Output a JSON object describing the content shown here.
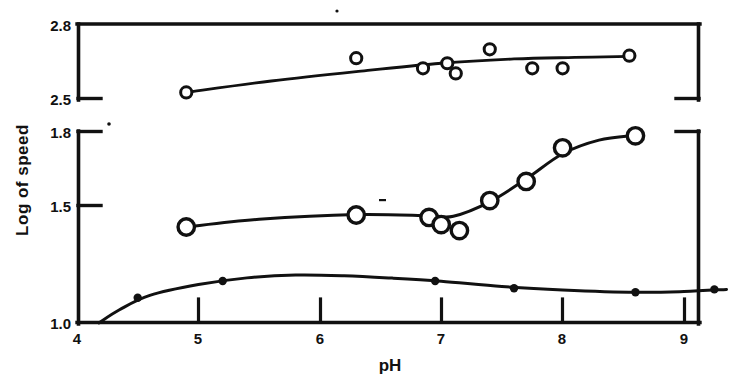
{
  "chart_data": {
    "type": "scatter",
    "title": "",
    "xlabel": "pH",
    "ylabel": "Log of speed",
    "xlim": [
      4,
      9.4
    ],
    "xticks": [
      4,
      5,
      6,
      7,
      8,
      9
    ],
    "xticklabels": [
      "4",
      "5",
      "6",
      "7",
      "8",
      "9"
    ],
    "grid": false,
    "legend": false,
    "broken_axis": true,
    "panels": [
      {
        "name": "upper-panel",
        "ylim": [
          2.5,
          2.8
        ],
        "yticks": [
          2.5,
          2.8
        ],
        "yticklabels": [
          "2.5",
          "2.8"
        ],
        "series": [
          {
            "name": "upper-curve",
            "marker": "open-circle",
            "marker_size": "small",
            "points": [
              {
                "x": 4.9,
                "y": 2.53
              },
              {
                "x": 6.3,
                "y": 2.665
              },
              {
                "x": 6.85,
                "y": 2.625
              },
              {
                "x": 7.05,
                "y": 2.645
              },
              {
                "x": 7.12,
                "y": 2.605
              },
              {
                "x": 7.4,
                "y": 2.7
              },
              {
                "x": 7.75,
                "y": 2.625
              },
              {
                "x": 8.0,
                "y": 2.625
              },
              {
                "x": 8.55,
                "y": 2.675
              }
            ],
            "fit_line": [
              {
                "x": 4.9,
                "y": 2.53
              },
              {
                "x": 5.6,
                "y": 2.575
              },
              {
                "x": 6.3,
                "y": 2.612
              },
              {
                "x": 7.0,
                "y": 2.645
              },
              {
                "x": 7.6,
                "y": 2.662
              },
              {
                "x": 8.1,
                "y": 2.668
              },
              {
                "x": 8.55,
                "y": 2.672
              }
            ]
          }
        ]
      },
      {
        "name": "lower-panel",
        "ylim": [
          1.0,
          1.8
        ],
        "yticks": [
          1.0,
          1.5,
          1.8
        ],
        "yticklabels": [
          "1.0",
          "1.5",
          "1.8"
        ],
        "series": [
          {
            "name": "middle-curve",
            "marker": "open-circle",
            "marker_size": "large",
            "points": [
              {
                "x": 4.9,
                "y": 1.4
              },
              {
                "x": 6.3,
                "y": 1.45
              },
              {
                "x": 6.9,
                "y": 1.44
              },
              {
                "x": 7.0,
                "y": 1.41
              },
              {
                "x": 7.15,
                "y": 1.385
              },
              {
                "x": 7.4,
                "y": 1.51
              },
              {
                "x": 7.7,
                "y": 1.59
              },
              {
                "x": 8.0,
                "y": 1.73
              },
              {
                "x": 8.6,
                "y": 1.78
              }
            ],
            "fit_line": [
              {
                "x": 4.9,
                "y": 1.4
              },
              {
                "x": 5.5,
                "y": 1.432
              },
              {
                "x": 6.3,
                "y": 1.452
              },
              {
                "x": 6.9,
                "y": 1.447
              },
              {
                "x": 7.1,
                "y": 1.445
              },
              {
                "x": 7.4,
                "y": 1.505
              },
              {
                "x": 7.7,
                "y": 1.6
              },
              {
                "x": 8.0,
                "y": 1.705
              },
              {
                "x": 8.3,
                "y": 1.762
              },
              {
                "x": 8.6,
                "y": 1.782
              }
            ]
          },
          {
            "name": "lower-curve",
            "marker": "filled-circle",
            "marker_size": "small",
            "points": [
              {
                "x": 4.5,
                "y": 1.105
              },
              {
                "x": 5.2,
                "y": 1.175
              },
              {
                "x": 6.95,
                "y": 1.175
              },
              {
                "x": 7.6,
                "y": 1.145
              },
              {
                "x": 8.6,
                "y": 1.128
              },
              {
                "x": 9.25,
                "y": 1.14
              }
            ],
            "fit_line": [
              {
                "x": 4.18,
                "y": 1.0
              },
              {
                "x": 4.35,
                "y": 1.055
              },
              {
                "x": 4.6,
                "y": 1.115
              },
              {
                "x": 5.0,
                "y": 1.16
              },
              {
                "x": 5.4,
                "y": 1.188
              },
              {
                "x": 5.8,
                "y": 1.2
              },
              {
                "x": 6.2,
                "y": 1.197
              },
              {
                "x": 6.6,
                "y": 1.187
              },
              {
                "x": 7.0,
                "y": 1.174
              },
              {
                "x": 7.5,
                "y": 1.152
              },
              {
                "x": 8.0,
                "y": 1.138
              },
              {
                "x": 8.6,
                "y": 1.128
              },
              {
                "x": 9.0,
                "y": 1.131
              },
              {
                "x": 9.35,
                "y": 1.14
              }
            ]
          }
        ]
      }
    ]
  },
  "axes": {
    "x_title": "pH",
    "y_title": "Log of speed",
    "x_tick_labels": [
      "4",
      "5",
      "6",
      "7",
      "8",
      "9"
    ],
    "y_tick_labels_upper": [
      "2.8",
      "2.5"
    ],
    "y_tick_labels_lower": [
      "1.8",
      "1.5",
      "1.0"
    ]
  },
  "style": {
    "ink": "#111111",
    "background": "#ffffff"
  }
}
